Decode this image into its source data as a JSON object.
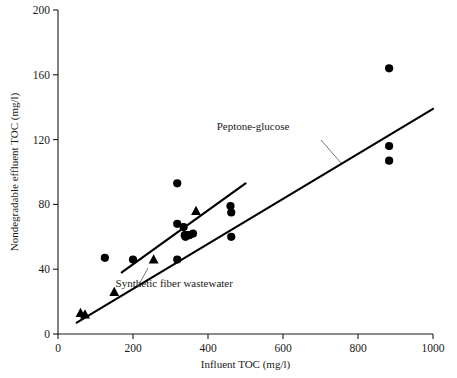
{
  "chart_data": {
    "type": "scatter",
    "title": "",
    "xlabel": "Influent TOC (mg/l)",
    "ylabel": "Nondegradable effluent TOC (mg/l)",
    "xlim": [
      0,
      1000
    ],
    "ylim": [
      0,
      200
    ],
    "xticks": [
      0,
      200,
      400,
      600,
      800,
      1000
    ],
    "yticks": [
      0,
      40,
      80,
      120,
      160,
      200
    ],
    "xtick_labels": [
      "0",
      "200",
      "400",
      "600",
      "800",
      "1000"
    ],
    "ytick_labels": [
      "0",
      "40",
      "80",
      "120",
      "160",
      "200"
    ],
    "grid": false,
    "legend": "none",
    "annotations": [
      {
        "text": "Peptone-glucose",
        "x": 520,
        "y": 126
      },
      {
        "text": "Synthetic fiber wastewater",
        "x": 310,
        "y": 29
      }
    ],
    "series": [
      {
        "name": "Peptone-glucose",
        "marker": "circle",
        "color": "#000000",
        "points": [
          [
            125,
            47
          ],
          [
            200,
            46
          ],
          [
            318,
            93
          ],
          [
            318,
            68
          ],
          [
            318,
            46
          ],
          [
            335,
            66
          ],
          [
            338,
            61
          ],
          [
            340,
            60
          ],
          [
            345,
            61
          ],
          [
            350,
            61
          ],
          [
            360,
            62
          ],
          [
            460,
            79
          ],
          [
            462,
            75
          ],
          [
            462,
            60
          ],
          [
            883,
            164
          ],
          [
            883,
            116
          ],
          [
            883,
            107
          ]
        ],
        "fit_line": {
          "x1": 50,
          "y1": 7,
          "x2": 1000,
          "y2": 139
        }
      },
      {
        "name": "Synthetic fiber wastewater",
        "marker": "triangle",
        "color": "#000000",
        "points": [
          [
            60,
            13
          ],
          [
            72,
            12
          ],
          [
            150,
            26
          ],
          [
            255,
            46
          ],
          [
            368,
            76
          ]
        ],
        "fit_line": {
          "x1": 170,
          "y1": 38,
          "x2": 500,
          "y2": 93
        }
      }
    ]
  },
  "axes": {
    "x_axis_label": "Influent TOC (mg/l)",
    "y_axis_label": "Nondegradable effluent TOC (mg/l)"
  },
  "labels": {
    "peptone_glucose": "Peptone-glucose",
    "synthetic_fiber": "Synthetic fiber wastewater"
  }
}
